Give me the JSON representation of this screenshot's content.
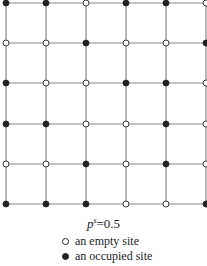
{
  "figure": {
    "type": "square-lattice",
    "columns": 6,
    "rows": 6,
    "sites": [
      [
        1,
        1,
        0,
        1,
        1,
        0
      ],
      [
        0,
        0,
        1,
        0,
        0,
        1
      ],
      [
        1,
        0,
        0,
        1,
        1,
        0
      ],
      [
        1,
        1,
        0,
        0,
        1,
        0
      ],
      [
        0,
        0,
        1,
        0,
        1,
        0
      ],
      [
        1,
        1,
        1,
        0,
        0,
        1
      ]
    ],
    "colors": {
      "line": "#888888",
      "site_stroke": "#222222",
      "occupied_fill": "#222222",
      "empty_fill": "#ffffff"
    }
  },
  "caption": {
    "variable": "p",
    "superscript": "s",
    "equals": "=0.5"
  },
  "legend": {
    "items": [
      {
        "symbol": "empty-circle",
        "label": "an empty site"
      },
      {
        "symbol": "filled-circle",
        "label": "an occupied site"
      }
    ]
  }
}
